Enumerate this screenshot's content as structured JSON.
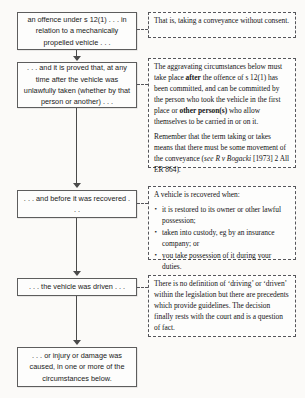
{
  "diagram": {
    "colors": {
      "box_border": "#5d5d5d",
      "note_border": "#55555a",
      "connector": "#4a4a4a",
      "background": "#fbfaf8",
      "text": "#1a1a1a"
    }
  },
  "steps": [
    {
      "id": "step-1",
      "text": "an offence under s 12(1) . . . in relation to a mechanically propelled vehicle . . ."
    },
    {
      "id": "step-2",
      "text": ". . . and it is proved that, at any time after the vehicle was unlawfully taken (whether by that person or another) . . ."
    },
    {
      "id": "step-3",
      "text": ". . . and before it was recovered . . ."
    },
    {
      "id": "step-4",
      "text": ". . . the vehicle was driven . . ."
    },
    {
      "id": "step-5",
      "text": ". . . or injury or damage was caused, in one or more of the circumstances below."
    }
  ],
  "notes": {
    "note1": {
      "p1": "That is, taking a conveyance without consent."
    },
    "note2": {
      "p1_a": "The aggravating circumstances below must take place ",
      "p1_b": "after",
      "p1_c": " the offence of s 12(1) has been committed, and can be committed by the person who took the vehicle in the first place or ",
      "p1_d": "other person(s)",
      "p1_e": " who allow themselves to be carried in or on it.",
      "p2_a": "Remember that the term taking or takes means that there must be some movement of the conveyance (",
      "p2_see": "see",
      "p2_b": " ",
      "p2_case": "R v Bogacki",
      "p2_c": " [1973] 2 All ER 864)."
    },
    "note3": {
      "lead": "A vehicle is recovered when:",
      "bullets": [
        "it is restored to its owner or other lawful possession;",
        "taken into custody, eg by an insurance company; or",
        "you take possession of it during your duties."
      ]
    },
    "note4": {
      "p1": "There is no definition of ‘driving’ or ‘driven’ within the legislation but there are precedents which provide guidelines. The decision finally rests with the court and is a question of fact."
    }
  }
}
